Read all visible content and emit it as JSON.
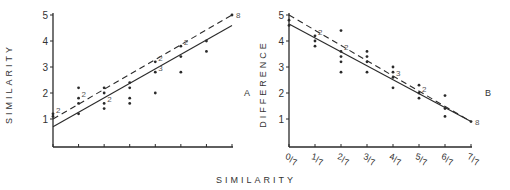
{
  "chart_data": [
    {
      "type": "scatter",
      "panel_label": "A",
      "ylabel": "SIMILARITY",
      "xlabel": "SIMILARITY",
      "ylim": [
        0,
        5
      ],
      "xlim": [
        0,
        7
      ],
      "yticks": [
        "1",
        "2",
        "3",
        "4",
        "5"
      ],
      "xticks": [
        0,
        1,
        2,
        3,
        4,
        5,
        6,
        7
      ],
      "xtick_labels": [],
      "points": [
        {
          "x": 0,
          "y": 1.2,
          "count": "2"
        },
        {
          "x": 0,
          "y": 1.1
        },
        {
          "x": 1,
          "y": 2.2
        },
        {
          "x": 1,
          "y": 1.8,
          "count": "2"
        },
        {
          "x": 1,
          "y": 1.6
        },
        {
          "x": 1,
          "y": 1.2
        },
        {
          "x": 2,
          "y": 2.2
        },
        {
          "x": 2,
          "y": 2.0
        },
        {
          "x": 2,
          "y": 1.6,
          "count": "2"
        },
        {
          "x": 2,
          "y": 1.4
        },
        {
          "x": 3,
          "y": 2.4
        },
        {
          "x": 3,
          "y": 2.2
        },
        {
          "x": 3,
          "y": 1.8
        },
        {
          "x": 3,
          "y": 1.6
        },
        {
          "x": 4,
          "y": 3.2,
          "count": "2"
        },
        {
          "x": 4,
          "y": 2.8,
          "count": "3"
        },
        {
          "x": 4,
          "y": 2.0
        },
        {
          "x": 5,
          "y": 3.8,
          "count": "2"
        },
        {
          "x": 5,
          "y": 3.4
        },
        {
          "x": 5,
          "y": 2.8
        },
        {
          "x": 6,
          "y": 4.0
        },
        {
          "x": 6,
          "y": 3.6
        },
        {
          "x": 7,
          "y": 5.0,
          "count": "8"
        }
      ],
      "lines": [
        {
          "name": "fit-solid",
          "style": "solid",
          "x": [
            0,
            7
          ],
          "y": [
            0.7,
            4.6
          ]
        },
        {
          "name": "fit-dashed",
          "style": "dashed",
          "x": [
            0,
            7
          ],
          "y": [
            1.0,
            5.0
          ]
        }
      ]
    },
    {
      "type": "scatter",
      "panel_label": "B",
      "ylabel": "DIFFERENCE",
      "xlabel": "SIMILARITY",
      "ylim": [
        0,
        5
      ],
      "xlim": [
        0,
        7
      ],
      "yticks": [
        "1",
        "2",
        "3",
        "4",
        "5"
      ],
      "xticks": [
        0,
        1,
        2,
        3,
        4,
        5,
        6,
        7
      ],
      "xtick_labels": [
        {
          "num": "0",
          "den": "7"
        },
        {
          "num": "1",
          "den": "7"
        },
        {
          "num": "2",
          "den": "7"
        },
        {
          "num": "3",
          "den": "7"
        },
        {
          "num": "4",
          "den": "7"
        },
        {
          "num": "5",
          "den": "7"
        },
        {
          "num": "6",
          "den": "7"
        },
        {
          "num": "7",
          "den": "7"
        }
      ],
      "points": [
        {
          "x": 0,
          "y": 4.8
        },
        {
          "x": 0,
          "y": 4.6
        },
        {
          "x": 1,
          "y": 4.2,
          "count": "2"
        },
        {
          "x": 1,
          "y": 4.0
        },
        {
          "x": 1,
          "y": 3.8
        },
        {
          "x": 2,
          "y": 4.4
        },
        {
          "x": 2,
          "y": 3.6,
          "count": "2"
        },
        {
          "x": 2,
          "y": 3.4
        },
        {
          "x": 2,
          "y": 3.2
        },
        {
          "x": 2,
          "y": 2.8
        },
        {
          "x": 3,
          "y": 3.6
        },
        {
          "x": 3,
          "y": 3.4
        },
        {
          "x": 3,
          "y": 3.2
        },
        {
          "x": 3,
          "y": 2.8
        },
        {
          "x": 4,
          "y": 3.0
        },
        {
          "x": 4,
          "y": 2.8
        },
        {
          "x": 4,
          "y": 2.6,
          "count": "3"
        },
        {
          "x": 4,
          "y": 2.2
        },
        {
          "x": 5,
          "y": 2.3
        },
        {
          "x": 5,
          "y": 2.0,
          "count": "2"
        },
        {
          "x": 5,
          "y": 1.8
        },
        {
          "x": 6,
          "y": 1.9
        },
        {
          "x": 6,
          "y": 1.4
        },
        {
          "x": 6,
          "y": 1.1
        },
        {
          "x": 7,
          "y": 0.9,
          "count": "8"
        }
      ],
      "lines": [
        {
          "name": "fit-solid",
          "style": "solid",
          "x": [
            0,
            7
          ],
          "y": [
            4.65,
            0.9
          ]
        },
        {
          "name": "fit-dashed",
          "style": "dashed",
          "x": [
            0,
            7
          ],
          "y": [
            5.0,
            0.9
          ]
        }
      ]
    }
  ],
  "shared_xlabel": "SIMILARITY"
}
